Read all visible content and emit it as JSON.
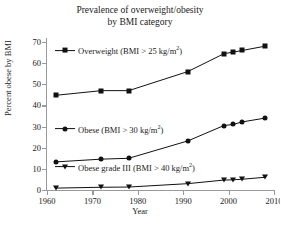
{
  "chart_data": {
    "type": "line",
    "title": "Prevalence of overweight/obesity by BMI category",
    "title_line1": "Prevalence of overweight/obesity",
    "title_line2": "by BMI category",
    "xlabel": "Year",
    "ylabel": "Percent obese by BMI",
    "xlim": [
      1960,
      2010
    ],
    "ylim": [
      0,
      70
    ],
    "xticks": [
      1960,
      1970,
      1980,
      1990,
      2000,
      2010
    ],
    "yticks": [
      0,
      10,
      20,
      30,
      40,
      50,
      60,
      70
    ],
    "grid": false,
    "legend_position": "inline-plot-area",
    "x": [
      1962,
      1972,
      1978,
      1991,
      1999,
      2001,
      2003,
      2008
    ],
    "series": [
      {
        "name": "Overweight (BMI > 25 kg/m2)",
        "label_text": "Overweight (BMI > 25 kg/m",
        "label_sup": "2",
        "label_tail": ")",
        "marker": "square",
        "color": "#111111",
        "values": [
          44.8,
          47.0,
          47.0,
          56.0,
          64.5,
          65.2,
          66.0,
          68.0
        ]
      },
      {
        "name": "Obese (BMI > 30 kg/m2)",
        "label_text": "Obese (BMI > 30 kg/m",
        "label_sup": "2",
        "label_tail": ")",
        "marker": "circle",
        "color": "#111111",
        "values": [
          13.3,
          14.6,
          15.0,
          23.2,
          30.5,
          31.0,
          32.2,
          34.0
        ]
      },
      {
        "name": "Obese grade III (BMI > 40 kg/m2)",
        "label_text": "Obese grade III (BMI > 40 kg/m",
        "label_sup": "2",
        "label_tail": ")",
        "marker": "triangle",
        "color": "#111111",
        "values": [
          0.9,
          1.3,
          1.4,
          3.0,
          4.7,
          4.8,
          5.1,
          6.0
        ]
      }
    ]
  }
}
